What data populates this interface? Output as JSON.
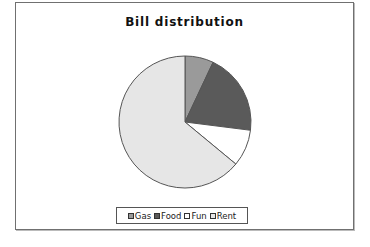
{
  "chart_data": {
    "type": "pie",
    "title": "Bill distribution",
    "categories": [
      "Gas",
      "Food",
      "Fun",
      "Rent"
    ],
    "values": [
      7,
      20,
      9,
      64
    ],
    "unit": "percent (estimated)",
    "start_angle": "12 o'clock, clockwise",
    "colors": [
      "#9a9a9a",
      "#5a5a5a",
      "#ffffff",
      "#e6e6e6"
    ],
    "legend": {
      "position": "bottom",
      "entries": [
        "Gas",
        "Food",
        "Fun",
        "Rent"
      ]
    },
    "xlabel": "",
    "ylabel": ""
  },
  "legend_items": [
    {
      "label": "Gas",
      "color": "#9a9a9a"
    },
    {
      "label": "Food",
      "color": "#5a5a5a"
    },
    {
      "label": "Fun",
      "color": "#ffffff"
    },
    {
      "label": "Rent",
      "color": "#e6e6e6"
    }
  ]
}
